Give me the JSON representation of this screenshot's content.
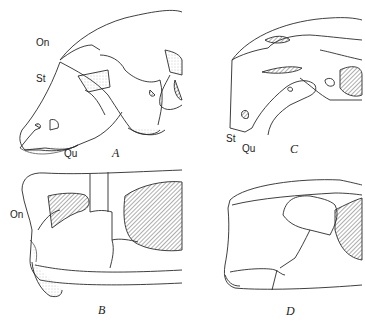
{
  "figure": {
    "panels": [
      {
        "id": "A",
        "label": "A",
        "view": "skull lateral view",
        "annotations": [
          {
            "text": "On"
          },
          {
            "text": "St"
          },
          {
            "text": "Qu"
          }
        ]
      },
      {
        "id": "B",
        "label": "B",
        "view": "skull lateral view (posterior)",
        "annotations": [
          {
            "text": "On"
          }
        ]
      },
      {
        "id": "C",
        "label": "C",
        "view": "skull lateral view",
        "annotations": [
          {
            "text": "St"
          },
          {
            "text": "Qu"
          }
        ]
      },
      {
        "id": "D",
        "label": "D",
        "view": "skull lateral view (posterior)",
        "annotations": []
      }
    ]
  },
  "colors": {
    "line": "#2a2a2a",
    "background": "#ffffff",
    "stipple": "#9a9a9a"
  }
}
